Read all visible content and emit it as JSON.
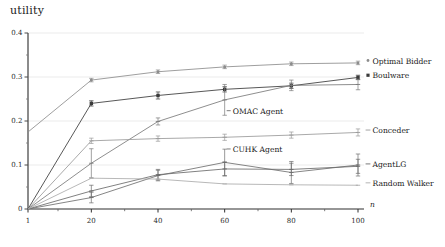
{
  "figure": {
    "axis_title": "utility",
    "xlabel": "n"
  },
  "chart_data": {
    "type": "line",
    "title": "utility",
    "xlabel": "n",
    "ylabel": "utility",
    "xlim": [
      1,
      100
    ],
    "ylim": [
      0,
      0.4
    ],
    "grid": true,
    "legend_position": "right-inline",
    "x": [
      1,
      20,
      40,
      60,
      80,
      100
    ],
    "xticks": [
      "1",
      "20",
      "40",
      "60",
      "80",
      "100"
    ],
    "yticks": [
      "0",
      "0.1",
      "0.2",
      "0.3",
      "0.4"
    ],
    "ytick_values": [
      0,
      0.1,
      0.2,
      0.3,
      0.4
    ],
    "series": [
      {
        "name": "Optimal Bidder",
        "color": "#8c8c8c",
        "marker": "dot",
        "label_marker": "•",
        "values": [
          0.175,
          0.293,
          0.312,
          0.323,
          0.33,
          0.332
        ],
        "errors": [
          0.0,
          0.004,
          0.004,
          0.004,
          0.004,
          0.004
        ]
      },
      {
        "name": "Boulware",
        "color": "#3a3a3a",
        "marker": "square",
        "label_marker": "■",
        "values": [
          0.0,
          0.24,
          0.258,
          0.272,
          0.28,
          0.299
        ],
        "errors": [
          0.0,
          0.006,
          0.008,
          0.006,
          0.006,
          0.005
        ]
      },
      {
        "name": "OMAC Agent",
        "color": "#7a7a7a",
        "marker": "tick",
        "label_marker": "–",
        "values": [
          0.0,
          0.104,
          0.199,
          0.248,
          0.281,
          0.283
        ],
        "errors": [
          0.0,
          0.033,
          0.008,
          0.035,
          0.012,
          0.012
        ]
      },
      {
        "name": "Conceder",
        "color": "#9a9a9a",
        "marker": "tick",
        "label_marker": "•",
        "values": [
          0.0,
          0.155,
          0.16,
          0.163,
          0.168,
          0.174
        ],
        "errors": [
          0.0,
          0.006,
          0.006,
          0.007,
          0.007,
          0.008
        ]
      },
      {
        "name": "CUHK Agent",
        "color": "#6f6f6f",
        "marker": "tick",
        "label_marker": "–",
        "values": [
          0.0,
          0.026,
          0.076,
          0.106,
          0.083,
          0.1
        ],
        "errors": [
          0.0,
          0.012,
          0.012,
          0.03,
          0.025,
          0.025
        ]
      },
      {
        "name": "AgentLG",
        "color": "#6a6a6a",
        "marker": "tick",
        "label_marker": "•",
        "values": [
          0.0,
          0.041,
          0.078,
          0.091,
          0.09,
          0.097
        ],
        "errors": [
          0.0,
          0.013,
          0.012,
          0.016,
          0.014,
          0.016
        ]
      },
      {
        "name": "Random Walker",
        "color": "#ababab",
        "marker": "tick",
        "label_marker": "–",
        "values": [
          0.0,
          0.07,
          0.068,
          0.057,
          0.055,
          0.054
        ],
        "errors": [
          0.0,
          0.0,
          0.0,
          0.0,
          0.0,
          0.0
        ]
      }
    ],
    "inline_annotations": [
      {
        "text": "OMAC Agent",
        "x": 60,
        "y": 0.218
      },
      {
        "text": "CUHK Agent",
        "x": 60,
        "y": 0.131
      }
    ],
    "right_labels": [
      {
        "text": "Optimal Bidder",
        "y": 0.332
      },
      {
        "text": "Boulware",
        "y": 0.299
      },
      {
        "text": "Conceder",
        "y": 0.174
      },
      {
        "text": "AgentLG",
        "y": 0.097
      },
      {
        "text": "Random Walker",
        "y": 0.054
      }
    ]
  }
}
